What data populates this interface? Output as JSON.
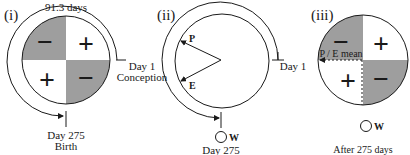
{
  "colors": {
    "shaded_quadrant": "#9e9e9e",
    "stroke": "#1a1a1a",
    "background": "#ffffff"
  },
  "panels": [
    {
      "id": "i",
      "label": "(i)",
      "arc_label": "91.3 days",
      "quadrant_signs": {
        "top_left": "−",
        "top_right": "+",
        "bottom_left": "+",
        "bottom_right": "−"
      },
      "start_marker": {
        "line1": "Day 1",
        "line2": "Conception"
      },
      "end_marker": {
        "line1": "Day 275",
        "line2": "Birth"
      }
    },
    {
      "id": "ii",
      "label": "(ii)",
      "vector_labels": {
        "p": "P",
        "e": "E"
      },
      "start_marker": {
        "line1": "Day 1"
      },
      "end_marker": {
        "line1": "Day 275"
      },
      "w_label": "W"
    },
    {
      "id": "iii",
      "label": "(iii)",
      "quadrant_signs": {
        "top_left": "−",
        "top_right": "+",
        "bottom_left": "+",
        "bottom_right": "−"
      },
      "mean_label": "P / E mean",
      "w_label": "W",
      "caption": "After 275 days"
    }
  ]
}
